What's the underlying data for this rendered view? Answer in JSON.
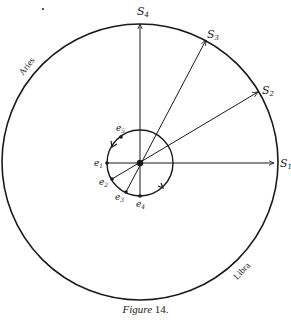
{
  "figure": {
    "caption_word": "Figure",
    "caption_number": "14."
  },
  "labels": {
    "S1": {
      "main": "S",
      "sub": "1"
    },
    "S2": {
      "main": "S",
      "sub": "2"
    },
    "S3": {
      "main": "S",
      "sub": "3"
    },
    "S4": {
      "main": "S",
      "sub": "4"
    },
    "e1": {
      "main": "e",
      "sub": "1"
    },
    "e2": {
      "main": "e",
      "sub": "2"
    },
    "e3": {
      "main": "e",
      "sub": "3"
    },
    "e4": {
      "main": "e",
      "sub": "4"
    },
    "e5": {
      "main": "e",
      "sub": "5"
    },
    "aries": "Aries",
    "libra": "Libra"
  },
  "colors": {
    "stroke": "#1a1a1a",
    "background": "#ffffff"
  }
}
